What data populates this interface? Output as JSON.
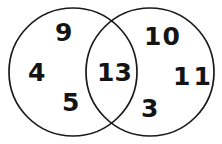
{
  "diagram": {
    "type": "venn",
    "background_color": "#ffffff",
    "stroke_color": "#1a1a1a",
    "text_color": "#141414",
    "left_circle": {
      "name": "left-set",
      "cx": 73,
      "cy": 72,
      "r": 64
    },
    "right_circle": {
      "name": "right-set",
      "cx": 150,
      "cy": 72,
      "r": 64
    },
    "left_only": {
      "label": "left-only-region",
      "values": [
        "9",
        "4",
        "5"
      ]
    },
    "intersection": {
      "label": "intersection-region",
      "values": [
        "13"
      ]
    },
    "right_only": {
      "label": "right-only-region",
      "values": [
        "10",
        "11",
        "3"
      ]
    },
    "all_values": [
      "9",
      "4",
      "5",
      "13",
      "10",
      "11",
      "3"
    ]
  }
}
